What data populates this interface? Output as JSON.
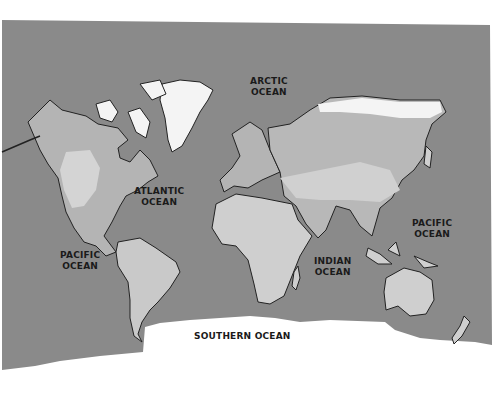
{
  "map": {
    "type": "world-map",
    "style": "grayscale relief",
    "colors": {
      "background": "#ffffff",
      "ocean": "#8a8a8a",
      "land_light": "#cfcfcf",
      "land_mid": "#a9a9a9",
      "ice": "#f4f4f4",
      "coastline": "#222222"
    },
    "labels": [
      {
        "id": "arctic",
        "line1": "ARCTIC",
        "line2": "OCEAN"
      },
      {
        "id": "atlantic",
        "line1": "ATLANTIC",
        "line2": "OCEAN"
      },
      {
        "id": "pacific-west",
        "line1": "PACIFIC",
        "line2": "OCEAN"
      },
      {
        "id": "pacific-east",
        "line1": "PACIFIC",
        "line2": "OCEAN"
      },
      {
        "id": "indian",
        "line1": "INDIAN",
        "line2": "OCEAN"
      },
      {
        "id": "southern",
        "line1": "SOUTHERN OCEAN",
        "line2": ""
      }
    ]
  }
}
